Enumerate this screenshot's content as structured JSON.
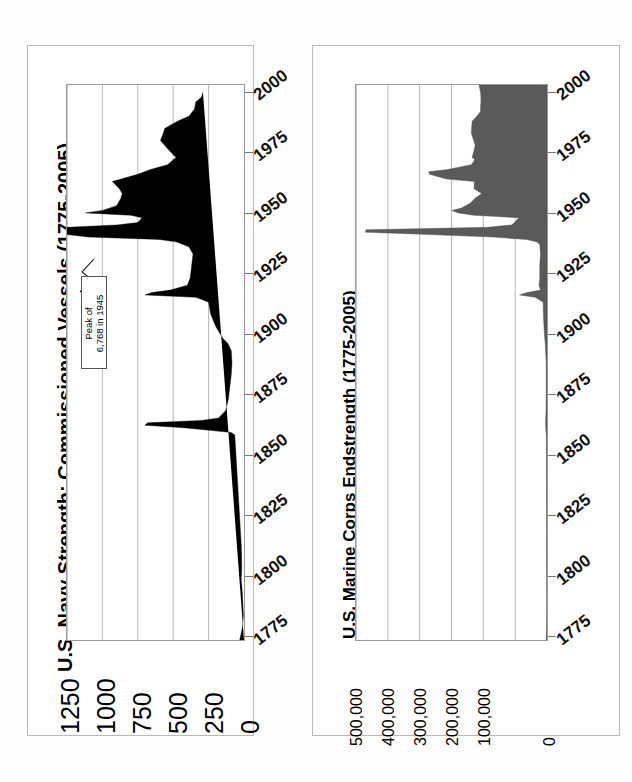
{
  "page": {
    "background": "#ffffff",
    "layout": "two side-by-side rotated area charts (landscape page scanned)"
  },
  "charts": [
    {
      "id": "navy",
      "title": "U.S. Navy Strength: Commissioned Vessels (1775-2005)",
      "fill_color": "#000000",
      "annotation": {
        "line1": "Peak of",
        "line2": "6,768 in 1945"
      },
      "value_axis_labels": [
        "1250",
        "1000",
        "750",
        "500",
        "250",
        "0"
      ],
      "year_axis_labels": [
        "2000",
        "1975",
        "1950",
        "1925",
        "1900",
        "1875",
        "1850",
        "1825",
        "1800",
        "1775"
      ]
    },
    {
      "id": "usmc",
      "title": "U.S. Marine Corps Endstrength (1775-2005)",
      "fill_color": "#5a5a5a",
      "value_axis_labels": [
        "500,000",
        "400,000",
        "300,000",
        "200,000",
        "100,000",
        "0"
      ],
      "year_axis_labels": [
        "2000",
        "1975",
        "1950",
        "1925",
        "1900",
        "1875",
        "1850",
        "1825",
        "1800",
        "1775"
      ]
    }
  ],
  "chart_data": [
    {
      "type": "area",
      "id": "navy",
      "title": "U.S. Navy Strength: Commissioned Vessels (1775-2005)",
      "orientation": "horizontal-rotated (years run bottom-to-top, values run right-to-left)",
      "xlabel": "Commissioned Vessels",
      "ylabel": "Year",
      "xlim": [
        0,
        1250
      ],
      "ylim": [
        1775,
        2005
      ],
      "grid": true,
      "legend": false,
      "value_ticks": [
        1250,
        1000,
        750,
        500,
        250,
        0
      ],
      "year_ticks": [
        2000,
        1975,
        1950,
        1925,
        1900,
        1875,
        1850,
        1825,
        1800,
        1775
      ],
      "annotations": [
        {
          "text": "Peak of 6,768 in 1945",
          "year": 1945,
          "value": 6768,
          "note": "off-scale spike clipped at axis maximum"
        }
      ],
      "x": [
        1775,
        1780,
        1785,
        1790,
        1795,
        1800,
        1805,
        1810,
        1815,
        1820,
        1825,
        1830,
        1835,
        1840,
        1845,
        1850,
        1855,
        1860,
        1861,
        1862,
        1863,
        1864,
        1865,
        1866,
        1867,
        1870,
        1875,
        1880,
        1885,
        1890,
        1895,
        1898,
        1900,
        1905,
        1910,
        1915,
        1917,
        1918,
        1919,
        1920,
        1922,
        1925,
        1930,
        1935,
        1938,
        1940,
        1941,
        1942,
        1943,
        1944,
        1945,
        1946,
        1947,
        1948,
        1950,
        1951,
        1952,
        1953,
        1955,
        1958,
        1960,
        1962,
        1965,
        1968,
        1970,
        1972,
        1975,
        1978,
        1980,
        1982,
        1985,
        1987,
        1990,
        1992,
        1995,
        1998,
        2000,
        2002,
        2005
      ],
      "y": [
        30,
        12,
        4,
        8,
        12,
        20,
        16,
        17,
        20,
        25,
        30,
        35,
        40,
        45,
        50,
        55,
        60,
        65,
        90,
        260,
        430,
        700,
        680,
        300,
        180,
        130,
        110,
        100,
        90,
        85,
        90,
        115,
        150,
        200,
        235,
        250,
        340,
        700,
        650,
        520,
        400,
        380,
        370,
        360,
        390,
        480,
        600,
        1100,
        1250,
        1250,
        1250,
        1250,
        900,
        750,
        720,
        800,
        1120,
        1000,
        900,
        870,
        860,
        880,
        930,
        750,
        660,
        540,
        480,
        530,
        560,
        590,
        570,
        560,
        470,
        390,
        350,
        340,
        300,
        290
      ],
      "data_note": "Values are estimated from the plotted silhouette; 1943-1946 WWII peak of 6,768 vessels is clipped off-scale."
    },
    {
      "type": "area",
      "id": "usmc",
      "title": "U.S. Marine Corps Endstrength (1775-2005)",
      "orientation": "horizontal-rotated (years run bottom-to-top, values run right-to-left)",
      "xlabel": "Endstrength",
      "ylabel": "Year",
      "xlim": [
        0,
        500000
      ],
      "ylim": [
        1775,
        2005
      ],
      "grid": true,
      "legend": false,
      "value_ticks": [
        500000,
        400000,
        300000,
        200000,
        100000,
        0
      ],
      "year_ticks": [
        2000,
        1975,
        1950,
        1925,
        1900,
        1875,
        1850,
        1825,
        1800,
        1775
      ],
      "x": [
        1775,
        1780,
        1790,
        1800,
        1810,
        1820,
        1830,
        1840,
        1845,
        1850,
        1860,
        1862,
        1865,
        1870,
        1880,
        1890,
        1898,
        1900,
        1905,
        1910,
        1915,
        1917,
        1918,
        1919,
        1920,
        1922,
        1925,
        1930,
        1935,
        1939,
        1940,
        1941,
        1942,
        1943,
        1944,
        1945,
        1946,
        1947,
        1948,
        1950,
        1951,
        1952,
        1953,
        1954,
        1956,
        1958,
        1960,
        1962,
        1965,
        1966,
        1967,
        1968,
        1969,
        1970,
        1972,
        1974,
        1975,
        1978,
        1980,
        1982,
        1985,
        1988,
        1990,
        1992,
        1994,
        1996,
        1998,
        2000,
        2002,
        2005
      ],
      "y": [
        2000,
        1000,
        600,
        900,
        1200,
        1000,
        1200,
        1300,
        1500,
        1500,
        1800,
        3000,
        3800,
        2500,
        2000,
        2100,
        4700,
        6000,
        8000,
        9500,
        10000,
        31000,
        72000,
        52000,
        17000,
        21000,
        19000,
        19000,
        17000,
        19000,
        28000,
        54000,
        143000,
        309000,
        475000,
        474000,
        156000,
        93000,
        85000,
        74000,
        192000,
        232000,
        249000,
        224000,
        201000,
        189000,
        171000,
        191000,
        190000,
        262000,
        285000,
        307000,
        310000,
        260000,
        198000,
        189000,
        196000,
        191000,
        188000,
        192000,
        198000,
        197000,
        196000,
        184000,
        174000,
        174000,
        173000,
        173000,
        174000,
        178000
      ],
      "data_note": "Values estimated from the plotted silhouette; WWII peak near 475,000 in 1944-45."
    }
  ]
}
